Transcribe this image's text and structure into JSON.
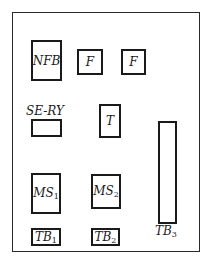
{
  "diagram": {
    "type": "panel-layout",
    "components": [
      {
        "id": "nfb",
        "label": "NFB"
      },
      {
        "id": "f1",
        "label": "F"
      },
      {
        "id": "f2",
        "label": "F"
      },
      {
        "id": "se-ry",
        "label": "SE-RY"
      },
      {
        "id": "t",
        "label": "T"
      },
      {
        "id": "tb3",
        "label": "TB",
        "sub": "3"
      },
      {
        "id": "ms1",
        "label": "MS",
        "sub": "1"
      },
      {
        "id": "ms2",
        "label": "MS",
        "sub": "2"
      },
      {
        "id": "tb1",
        "label": "TB",
        "sub": "1"
      },
      {
        "id": "tb2",
        "label": "TB",
        "sub": "2"
      }
    ]
  }
}
